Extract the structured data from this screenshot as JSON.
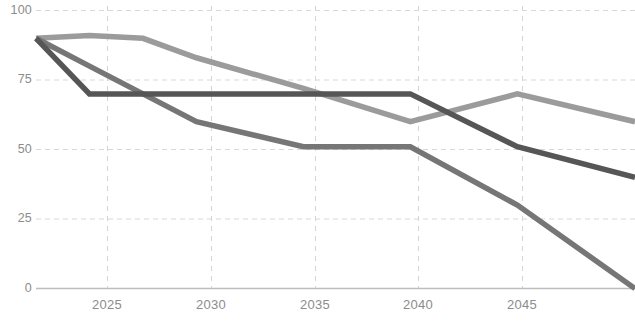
{
  "chart_data": {
    "type": "line",
    "title": "",
    "subtitle": "",
    "xlabel": "",
    "ylabel": "",
    "xlim": [
      2022.5,
      2050.5
    ],
    "ylim": [
      0,
      100
    ],
    "grid": true,
    "legend": "none",
    "x_tick_labels": [
      "2025",
      "2030",
      "2035",
      "2040",
      "2045"
    ],
    "x_ticks": [
      2025,
      2030,
      2035,
      2040,
      2045
    ],
    "y_tick_labels": [
      "0",
      "25",
      "50",
      "75",
      "100"
    ],
    "y_ticks": [
      0,
      25,
      50,
      75,
      100
    ],
    "x": [
      2022.5,
      2025,
      2027.5,
      2030,
      2035,
      2040,
      2045,
      2050.5
    ],
    "series": [
      {
        "name": "series-light",
        "color": "#9b9b9b",
        "values": [
          90,
          91,
          90,
          83,
          72,
          60,
          70,
          60
        ]
      },
      {
        "name": "series-medium",
        "color": "#767676",
        "values": [
          90,
          80,
          70,
          60,
          51,
          51,
          30,
          0
        ]
      },
      {
        "name": "series-dark",
        "color": "#565656",
        "values": [
          90,
          70,
          70,
          70,
          70,
          70,
          51,
          40
        ]
      }
    ]
  },
  "axis_style": {
    "grid_color": "#d8d8d8",
    "axis_color": "#bdbdbd",
    "tick_text_color": "#8c8c8c"
  }
}
